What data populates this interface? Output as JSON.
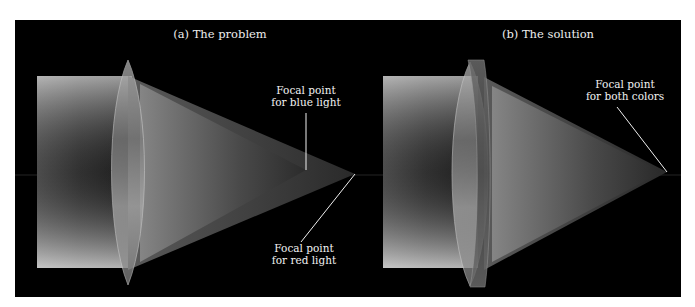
{
  "figure": {
    "background": "#000000",
    "page_background": "#ffffff",
    "panels": [
      {
        "id": "a",
        "title": "(a) The problem",
        "labels": [
          {
            "line1": "Focal point",
            "line2": "for blue light"
          },
          {
            "line1": "Focal point",
            "line2": "for red light"
          }
        ]
      },
      {
        "id": "b",
        "title": "(b) The solution",
        "labels": [
          {
            "line1": "Focal point",
            "line2": "for both colors"
          }
        ]
      }
    ],
    "colors": {
      "beam_light": "#e6e6e6",
      "beam_dark": "#1a1a1a",
      "lens": "#9a9a9a",
      "leader_line": "#f0f0f0",
      "optical_axis": "#3a3a3a"
    }
  }
}
